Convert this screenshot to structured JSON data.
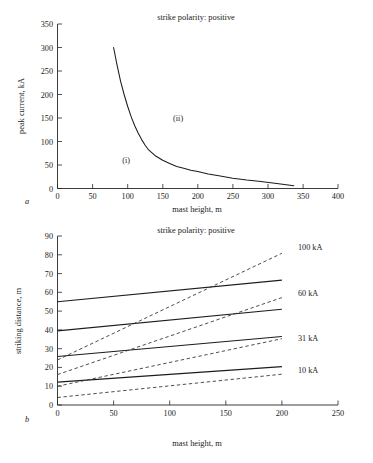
{
  "figure": {
    "panels": [
      "a",
      "b"
    ]
  },
  "panel_a": {
    "label": "a",
    "title": "strike polarity: positive",
    "xlabel": "mast height, m",
    "ylabel": "peak current, kA",
    "xticks": [
      "0",
      "50",
      "100",
      "150",
      "200",
      "250",
      "300",
      "350",
      "400"
    ],
    "yticks": [
      "0",
      "50",
      "100",
      "150",
      "200",
      "250",
      "300",
      "350"
    ],
    "region_i": "(i)",
    "region_ii": "(ii)"
  },
  "panel_b": {
    "label": "b",
    "title": "strike polarity: positive",
    "xlabel": "mast height, m",
    "ylabel": "striking distance, m",
    "xticks": [
      "0",
      "50",
      "100",
      "150",
      "200",
      "250"
    ],
    "yticks": [
      "0",
      "10",
      "20",
      "30",
      "40",
      "50",
      "60",
      "70",
      "80",
      "90"
    ],
    "series_labels": [
      "100 kA",
      "60 kA",
      "31 kA",
      "10 kA"
    ]
  },
  "chart_data": [
    {
      "type": "line",
      "panel": "a",
      "title": "strike polarity: positive",
      "xlabel": "mast height, m",
      "ylabel": "peak current, kA",
      "xlim": [
        0,
        400
      ],
      "ylim": [
        0,
        350
      ],
      "xticks": [
        0,
        50,
        100,
        150,
        200,
        250,
        300,
        350,
        400
      ],
      "yticks": [
        0,
        50,
        100,
        150,
        200,
        250,
        300,
        350
      ],
      "grid": false,
      "legend": "none",
      "annotations": [
        {
          "text": "(i)",
          "x": 98,
          "y": 60
        },
        {
          "text": "(ii)",
          "x": 172,
          "y": 150
        }
      ],
      "series": [
        {
          "name": "critical peak current",
          "style": "solid",
          "x": [
            80,
            85,
            90,
            95,
            100,
            105,
            110,
            115,
            120,
            125,
            130,
            140,
            150,
            160,
            170,
            180,
            190,
            200,
            215,
            230,
            250,
            270,
            290,
            310,
            337
          ],
          "y": [
            300,
            262,
            228,
            200,
            175,
            153,
            134,
            118,
            104,
            92,
            82,
            69,
            60,
            53,
            47,
            43,
            39,
            36,
            31,
            27,
            22,
            18,
            15,
            11,
            6
          ]
        }
      ]
    },
    {
      "type": "line",
      "panel": "b",
      "title": "strike polarity: positive",
      "xlabel": "mast height, m",
      "ylabel": "striking distance, m",
      "xlim": [
        0,
        250
      ],
      "ylim": [
        0,
        90
      ],
      "xticks": [
        0,
        50,
        100,
        150,
        200,
        250
      ],
      "yticks": [
        0,
        10,
        20,
        30,
        40,
        50,
        60,
        70,
        80,
        90
      ],
      "grid": false,
      "legend": "right-of-line-ends",
      "series": [
        {
          "name": "100 kA",
          "style": "solid",
          "label": "100 kA",
          "x": [
            0,
            200
          ],
          "y": [
            55.0,
            66.5
          ]
        },
        {
          "name": "60 kA",
          "style": "solid",
          "label": "60 kA",
          "x": [
            0,
            200
          ],
          "y": [
            39.5,
            51.0
          ]
        },
        {
          "name": "31 kA",
          "style": "solid",
          "label": "31 kA",
          "x": [
            0,
            200
          ],
          "y": [
            25.8,
            36.5
          ]
        },
        {
          "name": "10 kA",
          "style": "solid",
          "label": "10 kA",
          "x": [
            0,
            200
          ],
          "y": [
            12.2,
            20.4
          ]
        },
        {
          "name": "100 kA attractive radius",
          "style": "dashed",
          "x": [
            0,
            200
          ],
          "y": [
            24.0,
            80.8
          ]
        },
        {
          "name": "60 kA attractive radius",
          "style": "dashed",
          "x": [
            0,
            200
          ],
          "y": [
            16.2,
            57.2
          ]
        },
        {
          "name": "31 kA attractive radius",
          "style": "dashed",
          "x": [
            0,
            200
          ],
          "y": [
            10.0,
            35.3
          ]
        },
        {
          "name": "10 kA attractive radius",
          "style": "dashed",
          "x": [
            0,
            200
          ],
          "y": [
            4.0,
            16.4
          ]
        }
      ]
    }
  ]
}
